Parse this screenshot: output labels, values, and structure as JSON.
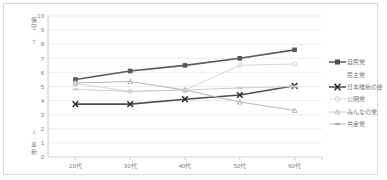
{
  "chart_data": {
    "type": "line",
    "title": "",
    "xlabel": "",
    "ylabel": "",
    "ylim": [
      0,
      10
    ],
    "grid": true,
    "legend_position": "right",
    "categories": [
      "20代",
      "30代",
      "40代",
      "50代",
      "60代"
    ],
    "yticks": [
      "0",
      "1",
      "2",
      "3",
      "4",
      "5",
      "6",
      "7",
      "8",
      "9",
      "10"
    ],
    "axis_poles": {
      "top_label": "保守",
      "top_arrow": "↑",
      "bottom_label": "革新",
      "bottom_arrow": "↓"
    },
    "series": [
      {
        "name": "自民党",
        "values": [
          5.5,
          6.1,
          6.5,
          7.0,
          7.6
        ],
        "color": "#595959",
        "marker": "square",
        "width": 1.6
      },
      {
        "name": "民主党",
        "values": [
          null,
          null,
          null,
          null,
          null
        ],
        "color": "#ffffff",
        "marker": "none",
        "width": 0
      },
      {
        "name": "日本維新の会",
        "values": [
          3.75,
          3.75,
          4.1,
          4.4,
          5.05
        ],
        "color": "#4d4d4d",
        "marker": "x",
        "width": 1.6
      },
      {
        "name": "公明党",
        "values": [
          5.2,
          4.65,
          4.75,
          6.5,
          6.6
        ],
        "color": "#d6d6d6",
        "marker": "circle",
        "width": 1.0
      },
      {
        "name": "みんなの党",
        "values": [
          5.25,
          5.35,
          4.75,
          3.9,
          3.3
        ],
        "color": "#b5b5b5",
        "marker": "triangle",
        "width": 1.0
      },
      {
        "name": "共産党",
        "values": [
          4.8,
          4.65,
          4.75,
          4.9,
          5.0
        ],
        "color": "#cccccc",
        "marker": "dash",
        "width": 1.0
      }
    ]
  },
  "legend": {
    "items": [
      {
        "label": "自民党"
      },
      {
        "label": "民主党"
      },
      {
        "label": "日本維新の会"
      },
      {
        "label": "公明党"
      },
      {
        "label": "みんなの党"
      },
      {
        "label": "共産党"
      }
    ]
  },
  "colors": {
    "frame_border": "#d9d9d9",
    "gridline": "#e6e6e6",
    "axis_line": "#bfbfbf",
    "tick_text": "#808080",
    "background": "#ffffff"
  }
}
